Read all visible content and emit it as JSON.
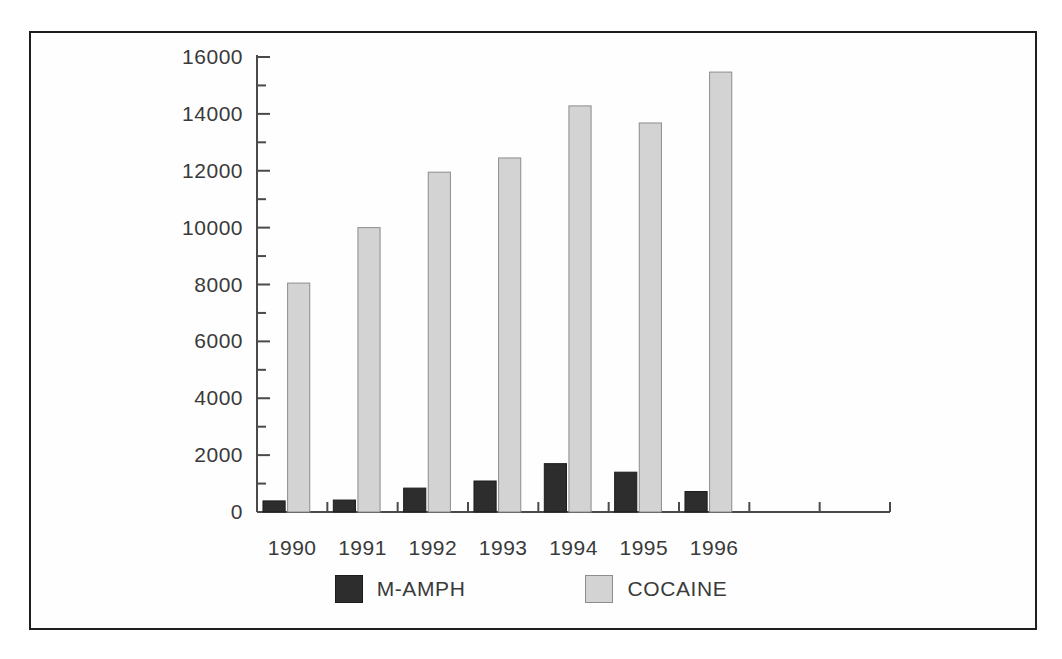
{
  "chart_data": {
    "type": "bar",
    "title": "",
    "subtitle": "",
    "xlabel": "",
    "ylabel": "",
    "categories": [
      "1990",
      "1991",
      "1992",
      "1993",
      "1994",
      "1995",
      "1996"
    ],
    "series": [
      {
        "name": "M-AMPH",
        "color": "#2d2d2d",
        "values": [
          390,
          420,
          840,
          1090,
          1700,
          1400,
          720
        ]
      },
      {
        "name": "COCAINE",
        "color": "#d3d3d3",
        "values": [
          8050,
          10000,
          11950,
          12450,
          14280,
          13680,
          15470
        ]
      }
    ],
    "ylim": [
      0,
      16000
    ],
    "y_major_ticks": [
      0,
      2000,
      4000,
      6000,
      8000,
      10000,
      12000,
      14000,
      16000
    ],
    "y_tick_labels": [
      "0",
      "2000",
      "4000",
      "6000",
      "8000",
      "10000",
      "12000",
      "14000",
      "16000"
    ],
    "y_minor_tick_interval": 1000,
    "grid": false,
    "legend_position": "bottom",
    "x_empty_slots_after_last": 2,
    "axis_color": "#4a4a4a",
    "text_color": "#3a3a3a",
    "background": "#ffffff",
    "border_color": "#1e1e1e"
  },
  "legend": {
    "items": [
      {
        "label": "M-AMPH",
        "swatch": "dark-square-swatch"
      },
      {
        "label": "COCAINE",
        "swatch": "light-square-swatch"
      }
    ]
  }
}
